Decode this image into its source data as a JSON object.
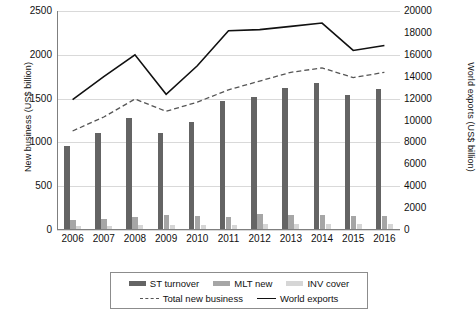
{
  "chart_data": {
    "type": "bar",
    "title": "",
    "categories": [
      "2006",
      "2007",
      "2008",
      "2009",
      "2010",
      "2011",
      "2012",
      "2013",
      "2014",
      "2015",
      "2016"
    ],
    "series": [
      {
        "name": "ST turnover",
        "axis": "left",
        "kind": "bar",
        "color": "#646464",
        "values": [
          960,
          1110,
          1280,
          1110,
          1230,
          1470,
          1515,
          1620,
          1675,
          1545,
          1610
        ]
      },
      {
        "name": "MLT new",
        "axis": "left",
        "kind": "bar",
        "color": "#a6a6a6",
        "values": [
          120,
          130,
          145,
          175,
          165,
          150,
          185,
          170,
          175,
          155,
          160
        ]
      },
      {
        "name": "INV cover",
        "axis": "left",
        "kind": "bar",
        "color": "#d6d6d6",
        "values": [
          45,
          50,
          55,
          60,
          60,
          60,
          65,
          65,
          70,
          65,
          70
        ]
      },
      {
        "name": "Total new business",
        "axis": "left",
        "kind": "line-dashed",
        "color": "#555555",
        "values": [
          1130,
          1290,
          1495,
          1355,
          1460,
          1600,
          1700,
          1800,
          1850,
          1740,
          1800
        ]
      },
      {
        "name": "World exports",
        "axis": "right",
        "kind": "line-solid",
        "color": "#111111",
        "values": [
          11900,
          14000,
          16000,
          12400,
          15000,
          18200,
          18300,
          18600,
          18900,
          16400,
          16850
        ]
      }
    ],
    "xlabel": "",
    "ylabel": "New business (US$ billion)",
    "y2label": "World exports (US$ billion)",
    "ylim": [
      0,
      2500
    ],
    "y2lim": [
      0,
      20000
    ],
    "yticks": [
      "0",
      "500",
      "1000",
      "1500",
      "2000",
      "2500"
    ],
    "y2ticks": [
      "0",
      "2000",
      "4000",
      "6000",
      "8000",
      "10000",
      "12000",
      "14000",
      "16000",
      "18000",
      "20000"
    ],
    "grid": true,
    "legend_position": "bottom"
  },
  "legend": {
    "row1": [
      {
        "label": "ST turnover",
        "swatch": "bar-st"
      },
      {
        "label": "MLT new",
        "swatch": "bar-mlt"
      },
      {
        "label": "INV cover",
        "swatch": "bar-inv"
      }
    ],
    "row2": [
      {
        "label": "Total new business",
        "swatch": "line-dashed"
      },
      {
        "label": "World exports",
        "swatch": "line-solid"
      }
    ]
  }
}
